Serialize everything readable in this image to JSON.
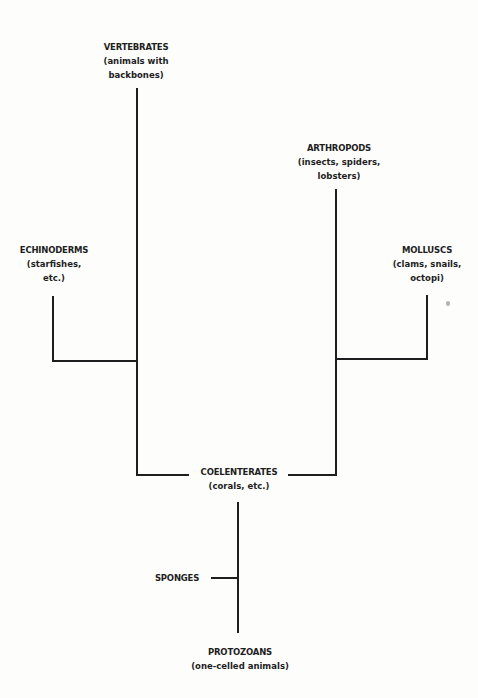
{
  "diagram": {
    "type": "phylogenetic-tree",
    "colors": {
      "line": "#1e1e1e",
      "background": "#fdfdfc"
    },
    "nodes": {
      "vertebrates": {
        "name": "VERTEBRATES",
        "desc1": "(animals with",
        "desc2": "backbones)"
      },
      "arthropods": {
        "name": "ARTHROPODS",
        "desc1": "(insects, spiders,",
        "desc2": "lobsters)"
      },
      "echinoderms": {
        "name": "ECHINODERMS",
        "desc1": "(starfishes,",
        "desc2": "etc.)"
      },
      "molluscs": {
        "name": "MOLLUSCS",
        "desc1": "(clams, snails,",
        "desc2": "octopi)"
      },
      "coelenterates": {
        "name": "COELENTERATES",
        "desc1": "(corals, etc.)"
      },
      "sponges": {
        "name": "SPONGES"
      },
      "protozoans": {
        "name": "PROTOZOANS",
        "desc1": "(one-celled animals)"
      }
    },
    "edges": [
      [
        "echinoderms",
        "vertebrates-branch"
      ],
      [
        "vertebrates",
        "coelenterates"
      ],
      [
        "molluscs",
        "arthropods-branch"
      ],
      [
        "arthropods",
        "coelenterates"
      ],
      [
        "coelenterates",
        "protozoans"
      ],
      [
        "sponges",
        "protozoans-branch"
      ]
    ]
  }
}
